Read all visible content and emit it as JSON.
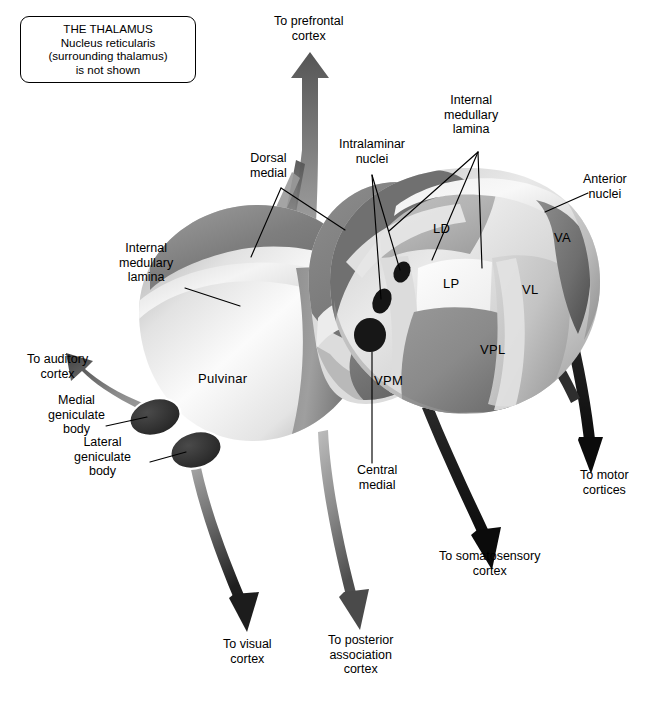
{
  "figure": {
    "background": "#ffffff"
  },
  "legend_box": {
    "line1": "THE THALAMUS",
    "line2": "Nucleus reticularis",
    "line3": "(surrounding thalamus)",
    "line4": "is not shown"
  },
  "nuclei_labels": [
    {
      "id": "LD",
      "text": "LD",
      "x": 441,
      "y": 229
    },
    {
      "id": "LP",
      "text": "LP",
      "x": 451,
      "y": 284
    },
    {
      "id": "VL",
      "text": "VL",
      "x": 530,
      "y": 290
    },
    {
      "id": "VA",
      "text": "VA",
      "x": 562,
      "y": 238
    },
    {
      "id": "VPL",
      "text": "VPL",
      "x": 492,
      "y": 350
    },
    {
      "id": "VPM",
      "text": "VPM",
      "x": 388,
      "y": 381
    },
    {
      "id": "Pulvinar",
      "text": "Pulvinar",
      "x": 222,
      "y": 379
    }
  ],
  "callout_labels": [
    {
      "id": "dorsal-medial",
      "text": "Dorsal\nmedial",
      "x": 268,
      "y": 165
    },
    {
      "id": "intralaminar",
      "text": "Intralaminar\nnuclei",
      "x": 372,
      "y": 151
    },
    {
      "id": "internal-med-lam-r",
      "text": "Internal\nmedullary\nlamina",
      "x": 471,
      "y": 115
    },
    {
      "id": "anterior-nuclei",
      "text": "Anterior\nnuclei",
      "x": 605,
      "y": 186
    },
    {
      "id": "internal-med-lam-l",
      "text": "Internal\nmedullary\nlamina",
      "x": 146,
      "y": 263
    },
    {
      "id": "medial-geniculate",
      "text": "Medial\ngeniculate\nbody",
      "x": 76,
      "y": 415
    },
    {
      "id": "lateral-geniculate",
      "text": "Lateral\ngeniculate\nbody",
      "x": 102,
      "y": 457
    },
    {
      "id": "central-medial",
      "text": "Central\nmedial",
      "x": 377,
      "y": 477
    }
  ],
  "projection_arrows": [
    {
      "id": "to-prefrontal-cortex",
      "label": "To prefrontal\ncortex",
      "label_x": 308,
      "label_y": 28,
      "color": "#7a7a7a"
    },
    {
      "id": "to-auditory-cortex",
      "label": "To auditory\ncortex",
      "label_x": 57,
      "label_y": 366,
      "color": "#6e6e6e"
    },
    {
      "id": "to-motor-cortices",
      "label": "To motor\ncortices",
      "label_x": 604,
      "label_y": 482,
      "color": "#111111"
    },
    {
      "id": "to-somatosensory-cortex",
      "label": "To somatosensory\ncortex",
      "label_x": 489,
      "label_y": 563,
      "color": "#111111"
    },
    {
      "id": "to-visual-cortex",
      "label": "To visual\ncortex",
      "label_x": 247,
      "label_y": 651,
      "color": "#3a3a3a"
    },
    {
      "id": "to-posterior-association-cortex",
      "label": "To posterior\nassociation\ncortex",
      "label_x": 360,
      "label_y": 655,
      "color": "#5a5a5a"
    }
  ],
  "palette": {
    "line": "#000000",
    "text": "#000000",
    "lamina_light": "#e8e8e8",
    "nucleus_mid": "#a8a8a8",
    "nucleus_dark": "#6d6d6d",
    "nucleus_darkest": "#3b3b3b",
    "pulvinar_light": "#f1f1f1",
    "geniculate": "#2b2b2b"
  }
}
